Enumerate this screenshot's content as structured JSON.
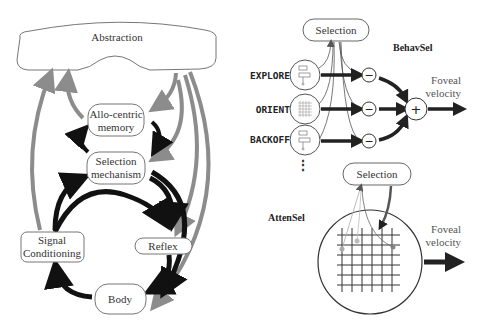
{
  "left_diagram": {
    "nodes": {
      "abstraction": "Abstraction",
      "allocentric_memory_line1": "Allo-centric",
      "allocentric_memory_line2": "memory",
      "selection_mechanism_line1": "Selection",
      "selection_mechanism_line2": "mechanism",
      "signal_conditioning_line1": "Signal",
      "signal_conditioning_line2": "Conditioning",
      "reflex": "Reflex",
      "body": "Body"
    },
    "colors": {
      "black_arrow": "#111111",
      "gray_arrow": "#8c8c8c",
      "node_stroke": "#777777"
    }
  },
  "behavsel": {
    "title": "BehavSel",
    "selection": "Selection",
    "behaviors": [
      "EXPLORE",
      "ORIENT",
      "BACKOFF"
    ],
    "minus_symbol": "−",
    "plus_symbol": "+",
    "output_line1": "Foveal",
    "output_line2": "velocity",
    "ellipsis": "⋮"
  },
  "attensel": {
    "title": "AttenSel",
    "selection": "Selection",
    "output_line1": "Foveal",
    "output_line2": "velocity"
  }
}
